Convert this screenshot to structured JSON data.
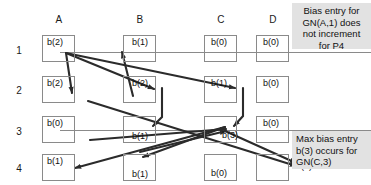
{
  "diagram": {
    "column_headers": [
      "A",
      "B",
      "C",
      "D"
    ],
    "row_headers": [
      "1",
      "2",
      "3",
      "4"
    ],
    "cells": [
      {
        "col": "A",
        "row": "1",
        "label": "b(2)"
      },
      {
        "col": "B",
        "row": "1",
        "label": "b(1)"
      },
      {
        "col": "C",
        "row": "1",
        "label": "b(0)"
      },
      {
        "col": "D",
        "row": "1",
        "label": "b(0)"
      },
      {
        "col": "A",
        "row": "2",
        "label": "b(2)"
      },
      {
        "col": "B",
        "row": "2",
        "label": "b(2)"
      },
      {
        "col": "C",
        "row": "2",
        "label": "b(1)"
      },
      {
        "col": "D",
        "row": "2",
        "label": "b(0)"
      },
      {
        "col": "A",
        "row": "3",
        "label": "b(0)"
      },
      {
        "col": "B",
        "row": "3",
        "label": "b(1)"
      },
      {
        "col": "C",
        "row": "3",
        "label": "b(3)"
      },
      {
        "col": "D",
        "row": "3",
        "label": "b(0)"
      },
      {
        "col": "A",
        "row": "4",
        "label": "b(1)"
      },
      {
        "col": "B",
        "row": "4",
        "label": "b(1)"
      },
      {
        "col": "C",
        "row": "4",
        "label": "b(0)"
      },
      {
        "col": "D",
        "row": "4",
        "label": "b(2)"
      }
    ],
    "notes": [
      {
        "id": "note-top",
        "text": "Bias entry for GN(A,1) does not increment for P4"
      },
      {
        "id": "note-bottom",
        "text": "Max bias entry b(3) occurs for GN(C,3)"
      }
    ],
    "colors": {
      "box_border": "#8a8a8a",
      "arrow": "#2b2b2b",
      "guide_line": "#7d7d7d",
      "note_background": "#e2e2e2",
      "text": "#111111"
    }
  }
}
